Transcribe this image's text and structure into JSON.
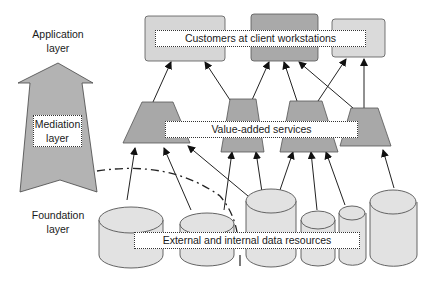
{
  "diagram": {
    "layers": {
      "application": "Application layer",
      "application_lines": [
        "Application",
        "layer"
      ],
      "mediation_lines": [
        "Mediation",
        "layer"
      ],
      "foundation_lines": [
        "Foundation",
        "layer"
      ]
    },
    "labels": {
      "customers": "Customers at client workstations",
      "services": "Value-added services",
      "resources": "External and internal data resources"
    },
    "nodes": {
      "workstations": [
        {
          "id": "ws1",
          "fill": "#d6d6d6"
        },
        {
          "id": "ws2",
          "fill": "#a9a9a9"
        },
        {
          "id": "ws3",
          "fill": "#dadada"
        }
      ],
      "services": [
        {
          "id": "svc1",
          "fill": "#a8a8a8"
        },
        {
          "id": "svc2",
          "fill": "#a8a8a8"
        },
        {
          "id": "svc3",
          "fill": "#a8a8a8"
        },
        {
          "id": "svc4",
          "fill": "#a8a8a8"
        }
      ],
      "resources": [
        {
          "id": "db1"
        },
        {
          "id": "db2"
        },
        {
          "id": "db3"
        },
        {
          "id": "db4"
        },
        {
          "id": "db5"
        },
        {
          "id": "db6"
        }
      ]
    },
    "colors": {
      "arrow_fill": "#b3b3b3",
      "cylinder_fill": "#e2e2e2",
      "stroke": "#3a3a3a"
    }
  }
}
